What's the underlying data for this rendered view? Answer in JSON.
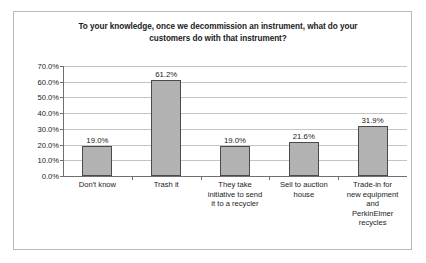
{
  "chart_data": {
    "type": "bar",
    "title": "To your knowledge, once we decommission an instrument, what do your customers do with that instrument?",
    "title_line1": "To your knowledge, once we decommission an instrument, what do your",
    "title_line2": "customers do with that instrument?",
    "xlabel": "",
    "ylabel": "",
    "ylim": [
      0,
      70
    ],
    "grid": true,
    "legend": false,
    "bar_color": "#b2b2b2",
    "bar_border_color": "#4a4a4a",
    "categories": [
      "Don't know",
      "Trash it",
      "They take initiative to send it to a recycler",
      "Sell to auction house",
      "Trade-in for new equipment and PerkinElmer recycles"
    ],
    "category_lines": [
      [
        "Don't know"
      ],
      [
        "Trash it"
      ],
      [
        "They take",
        "initiative to send",
        "it to a recycler"
      ],
      [
        "Sell to auction",
        "house"
      ],
      [
        "Trade-in for",
        "new equipment",
        "and",
        "PerkinElmer",
        "recycles"
      ]
    ],
    "values": [
      19.0,
      61.2,
      19.0,
      21.6,
      31.9
    ],
    "data_labels": [
      "19.0%",
      "61.2%",
      "19.0%",
      "21.6%",
      "31.9%"
    ],
    "ytick_values": [
      0,
      10,
      20,
      30,
      40,
      50,
      60,
      70
    ],
    "ytick_labels": [
      "0.0%",
      "10.0%",
      "20.0%",
      "30.0%",
      "40.0%",
      "50.0%",
      "60.0%",
      "70.0%"
    ]
  }
}
